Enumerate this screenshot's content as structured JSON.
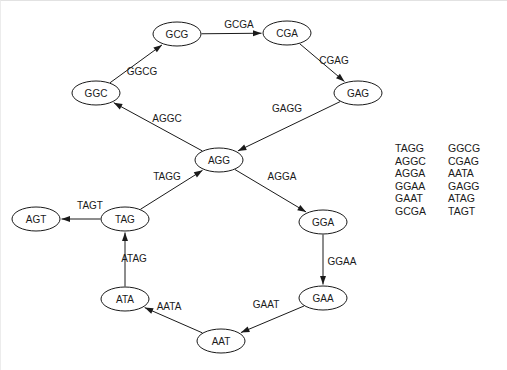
{
  "figure": {
    "background_color": "#ffffff",
    "stroke_color": "#1a1a1a"
  },
  "graph": {
    "nodes": [
      {
        "id": "GCG",
        "label": "GCG",
        "x": 176,
        "y": 33,
        "rx": 24,
        "ry": 12
      },
      {
        "id": "CGA",
        "label": "CGA",
        "x": 286,
        "y": 32,
        "rx": 24,
        "ry": 12
      },
      {
        "id": "GAG",
        "label": "GAG",
        "x": 357,
        "y": 92,
        "rx": 24,
        "ry": 12
      },
      {
        "id": "GGC",
        "label": "GGC",
        "x": 95,
        "y": 92,
        "rx": 24,
        "ry": 12
      },
      {
        "id": "AGG",
        "label": "AGG",
        "x": 218,
        "y": 159,
        "rx": 24,
        "ry": 12
      },
      {
        "id": "AGT",
        "label": "AGT",
        "x": 35,
        "y": 218,
        "rx": 24,
        "ry": 12
      },
      {
        "id": "TAG",
        "label": "TAG",
        "x": 124,
        "y": 218,
        "rx": 24,
        "ry": 12
      },
      {
        "id": "GGA",
        "label": "GGA",
        "x": 322,
        "y": 221,
        "rx": 24,
        "ry": 12
      },
      {
        "id": "ATA",
        "label": "ATA",
        "x": 124,
        "y": 298,
        "rx": 24,
        "ry": 12
      },
      {
        "id": "GAA",
        "label": "GAA",
        "x": 322,
        "y": 297,
        "rx": 24,
        "ry": 12
      },
      {
        "id": "AAT",
        "label": "AAT",
        "x": 220,
        "y": 340,
        "rx": 24,
        "ry": 12
      }
    ],
    "edges": [
      {
        "from": "GCG",
        "to": "CGA",
        "label": "GCGA",
        "lx": 238,
        "ly": 23
      },
      {
        "from": "CGA",
        "to": "GAG",
        "label": "CGAG",
        "lx": 333,
        "ly": 59
      },
      {
        "from": "GAG",
        "to": "AGG",
        "label": "GAGG",
        "lx": 286,
        "ly": 107
      },
      {
        "from": "AGG",
        "to": "GGC",
        "label": "AGGC",
        "lx": 166,
        "ly": 117
      },
      {
        "from": "GGC",
        "to": "GCG",
        "label": "GGCG",
        "lx": 141,
        "ly": 70
      },
      {
        "from": "AGG",
        "to": "GGA",
        "label": "AGGA",
        "lx": 281,
        "ly": 175
      },
      {
        "from": "GGA",
        "to": "GAA",
        "label": "GGAA",
        "lx": 341,
        "ly": 260
      },
      {
        "from": "GAA",
        "to": "AAT",
        "label": "GAAT",
        "lx": 265,
        "ly": 303
      },
      {
        "from": "AAT",
        "to": "ATA",
        "label": "AATA",
        "lx": 168,
        "ly": 305
      },
      {
        "from": "ATA",
        "to": "TAG",
        "label": "ATAG",
        "lx": 133,
        "ly": 257
      },
      {
        "from": "TAG",
        "to": "AGG",
        "label": "TAGG",
        "lx": 166,
        "ly": 175
      },
      {
        "from": "TAG",
        "to": "AGT",
        "label": "TAGT",
        "lx": 89,
        "ly": 204
      }
    ]
  },
  "kmer_list": {
    "column_left": [
      "TAGG",
      "AGGC",
      "AGGA",
      "GGAA",
      "GAAT",
      "GCGA"
    ],
    "column_right": [
      "GGCG",
      "CGAG",
      "AATA",
      "GAGG",
      "ATAG",
      "TAGT"
    ],
    "left_x": 394,
    "right_x": 447,
    "start_y": 147,
    "line_height": 12.6
  }
}
